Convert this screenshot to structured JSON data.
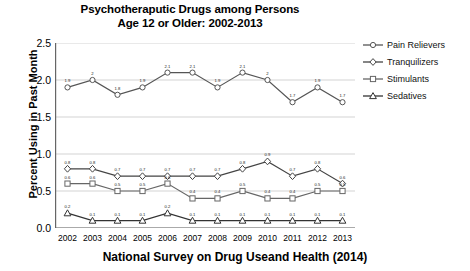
{
  "title": {
    "line1": "Psychotheraputic Drugs among Persons",
    "line2": "Age 12 or Older: 2002-2013"
  },
  "footer": "National Survey on Drug Useand Health (2014)",
  "axis": {
    "ylabel": "Percent Using in Past Month",
    "yticks": [
      "0.0",
      "0.5",
      "1.0",
      "1.5",
      "2.0",
      "2.5"
    ]
  },
  "legend": [
    {
      "label": "Pain Relievers",
      "marker": "circle",
      "color": "#555555"
    },
    {
      "label": "Tranquilizers",
      "marker": "diamond",
      "color": "#444444"
    },
    {
      "label": "Stimulants",
      "marker": "square",
      "color": "#666666"
    },
    {
      "label": "Sedatives",
      "marker": "triangle",
      "color": "#333333"
    }
  ],
  "chart_data": {
    "type": "line",
    "title": "Psychotheraputic Drugs among Persons Age 12 or Older: 2002-2013",
    "xlabel": "",
    "ylabel": "Percent Using in Past Month",
    "ylim": [
      0.0,
      2.5
    ],
    "ytick_step": 0.5,
    "grid": true,
    "legend_position": "right",
    "categories": [
      "2002",
      "2003",
      "2004",
      "2005",
      "2006",
      "2007",
      "2008",
      "2009",
      "2010",
      "2011",
      "2012",
      "2013"
    ],
    "series": [
      {
        "name": "Pain Relievers",
        "marker": "circle",
        "values": [
          1.9,
          2.0,
          1.8,
          1.9,
          2.1,
          2.1,
          1.9,
          2.1,
          2.0,
          1.7,
          1.9,
          1.7
        ],
        "labels": [
          "1.9",
          "2",
          "1.8",
          "1.9",
          "2.1",
          "2.1",
          "1.9",
          "2.1",
          "2",
          "1.7",
          "1.9",
          "1.7"
        ]
      },
      {
        "name": "Tranquilizers",
        "marker": "diamond",
        "values": [
          0.8,
          0.8,
          0.7,
          0.7,
          0.7,
          0.7,
          0.7,
          0.8,
          0.9,
          0.7,
          0.8,
          0.6
        ],
        "labels": [
          "0.8",
          "0.8",
          "0.7",
          "0.7",
          "0.7",
          "0.7",
          "0.7",
          "0.8",
          "0.9",
          "0.7",
          "0.8",
          "0.6"
        ]
      },
      {
        "name": "Stimulants",
        "marker": "square",
        "values": [
          0.6,
          0.6,
          0.5,
          0.5,
          0.6,
          0.4,
          0.4,
          0.5,
          0.4,
          0.4,
          0.5,
          0.5
        ],
        "labels": [
          "0.6",
          "0.6",
          "0.5",
          "0.5",
          "0.6",
          "0.4",
          "0.4",
          "0.5",
          "0.4",
          "0.4",
          "0.5",
          "0.5"
        ]
      },
      {
        "name": "Sedatives",
        "marker": "triangle",
        "values": [
          0.2,
          0.1,
          0.1,
          0.1,
          0.2,
          0.1,
          0.1,
          0.1,
          0.1,
          0.1,
          0.1,
          0.1
        ],
        "labels": [
          "0.2",
          "0.1",
          "0.1",
          "0.1",
          "0.2",
          "0.1",
          "0.1",
          "0.1",
          "0.1",
          "0.1",
          "0.1",
          "0.1"
        ]
      }
    ]
  }
}
